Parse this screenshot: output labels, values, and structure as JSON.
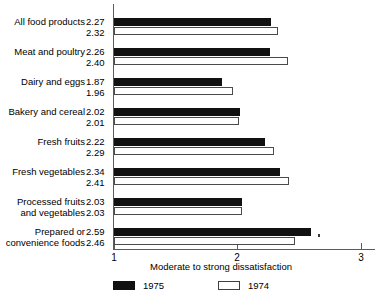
{
  "chart_data": {
    "type": "bar",
    "orientation": "horizontal",
    "title": "",
    "xlabel": "Moderate to strong dissatisfaction",
    "ylabel": "",
    "xlim": [
      1,
      3.1
    ],
    "xticks": [
      1,
      2,
      3
    ],
    "xticklabels": [
      "1",
      "2",
      "3"
    ],
    "grid": false,
    "legend_position": "bottom",
    "categories": [
      "All food products",
      "Meat and poultry",
      "Dairy and eggs",
      "Bakery and cereal",
      "Fresh fruits",
      "Fresh vegetables",
      "Processed fruits\nand vegetables",
      "Prepared or\nconvenience foods"
    ],
    "series": [
      {
        "name": "1975",
        "color": "#111111",
        "values": [
          2.27,
          2.26,
          1.87,
          2.02,
          2.22,
          2.34,
          2.03,
          2.59
        ]
      },
      {
        "name": "1974",
        "color": "#ffffff",
        "values": [
          2.32,
          2.4,
          1.96,
          2.01,
          2.29,
          2.41,
          2.03,
          2.46
        ]
      }
    ]
  },
  "legend": {
    "items": [
      {
        "label": "1975",
        "swatch": "dark"
      },
      {
        "label": "1974",
        "swatch": "light"
      }
    ]
  }
}
